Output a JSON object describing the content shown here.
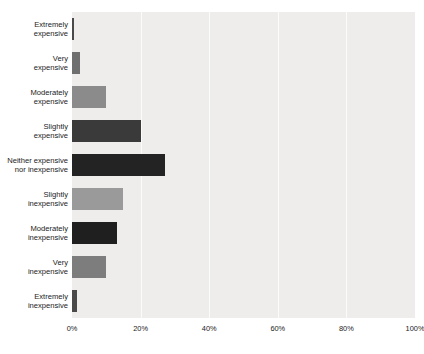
{
  "chart": {
    "title": "",
    "subtitle": "",
    "background_color": "#ffffff",
    "plot_background_color": "#eeedec",
    "gridline_color": "#fbfbfb",
    "label_color": "#1b1b1b"
  },
  "chart_data": {
    "type": "bar",
    "orientation": "horizontal",
    "title": "",
    "xlabel": "",
    "ylabel": "",
    "xlim": [
      0,
      100
    ],
    "grid": true,
    "legend": false,
    "xtick_labels": [
      "0%",
      "20%",
      "40%",
      "60%",
      "80%",
      "100%"
    ],
    "xtick_values": [
      0,
      20,
      40,
      60,
      80,
      100
    ],
    "categories": [
      "Extremely expensive",
      "Very expensive",
      "Moderately expensive",
      "Slightly expensive",
      "Neither expensive nor inexpensive",
      "Slightly inexpensive",
      "Moderately inexpensive",
      "Very inexpensive",
      "Extremely inexpensive"
    ],
    "category_lines": [
      [
        "Extremely",
        "expensive"
      ],
      [
        "Very",
        "expensive"
      ],
      [
        "Moderately",
        "expensive"
      ],
      [
        "Slightly",
        "expensive"
      ],
      [
        "Neither expensive",
        "nor inexpensive"
      ],
      [
        "Slightly",
        "inexpensive"
      ],
      [
        "Moderately",
        "inexpensive"
      ],
      [
        "Very",
        "inexpensive"
      ],
      [
        "Extremely",
        "inexpensive"
      ]
    ],
    "values": [
      0.4,
      2.3,
      10.0,
      20.0,
      27.0,
      15.0,
      13.0,
      10.0,
      1.5
    ],
    "bar_colors": [
      "#4a4a4a",
      "#6f6f6f",
      "#8b8b8b",
      "#3a3a3a",
      "#232323",
      "#9a9a9a",
      "#1f1f1f",
      "#7d7d7d",
      "#4a4a4a"
    ]
  }
}
